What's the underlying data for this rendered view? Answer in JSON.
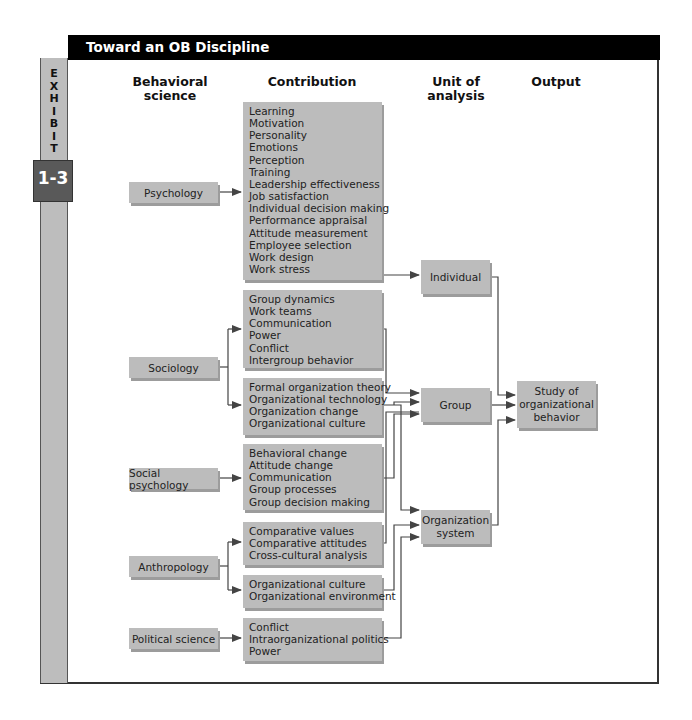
{
  "header": {
    "title": "Toward an OB Discipline"
  },
  "exhibit": {
    "label": "EXHIBIT",
    "number": "1-3"
  },
  "columns": {
    "behavioral_science": "Behavioral\nscience",
    "contribution": "Contribution",
    "unit_of_analysis": "Unit of\nanalysis",
    "output": "Output"
  },
  "sources": [
    {
      "id": "psychology",
      "label": "Psychology"
    },
    {
      "id": "sociology",
      "label": "Sociology"
    },
    {
      "id": "social_psychology",
      "label": "Social psychology"
    },
    {
      "id": "anthropology",
      "label": "Anthropology"
    },
    {
      "id": "political_science",
      "label": "Political science"
    }
  ],
  "contributions": {
    "psychology": [
      "Learning",
      "Motivation",
      "Personality",
      "Emotions",
      "Perception",
      "Training",
      "Leadership effectiveness",
      "Job satisfaction",
      "Individual decision making",
      "Performance appraisal",
      "Attitude measurement",
      "Employee selection",
      "Work design",
      "Work stress"
    ],
    "sociology_1": [
      "Group dynamics",
      "Work teams",
      "Communication",
      "Power",
      "Conflict",
      "Intergroup behavior"
    ],
    "sociology_2": [
      "Formal organization theory",
      "Organizational technology",
      "Organization change",
      "Organizational culture"
    ],
    "social_psychology": [
      "Behavioral change",
      "Attitude change",
      "Communication",
      "Group processes",
      "Group decision making"
    ],
    "anthropology_1": [
      "Comparative values",
      "Comparative attitudes",
      "Cross-cultural analysis"
    ],
    "anthropology_2": [
      "Organizational culture",
      "Organizational environment"
    ],
    "political_science": [
      "Conflict",
      "Intraorganizational politics",
      "Power"
    ]
  },
  "units": {
    "individual": "Individual",
    "group": "Group",
    "organization_system": "Organization\nsystem"
  },
  "output": {
    "label": "Study of\norganizational\nbehavior"
  },
  "colors": {
    "header_bg": "#000000",
    "box_fill": "#bcbcbc",
    "box_shadow": "#9c9c9c",
    "sidebar": "#bdbdbd",
    "exhibit_num_bg": "#595959",
    "line": "#444444"
  }
}
